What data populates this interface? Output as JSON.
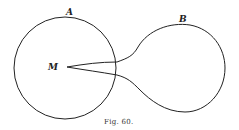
{
  "figure": {
    "caption": "Fig. 60.",
    "labels": {
      "circle_a": "A",
      "circle_b": "B",
      "point_m": "M"
    }
  }
}
